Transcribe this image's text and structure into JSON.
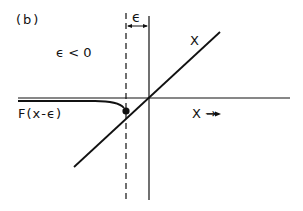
{
  "panel_label": "(b)",
  "epsilon_label": "ϵ",
  "condition_label": "ϵ < 0",
  "diagonal_label": "X",
  "axis_label": "X →",
  "curve_label": "F(x-ϵ)",
  "colors": {
    "stroke": "#111111",
    "background": "#ffffff"
  }
}
